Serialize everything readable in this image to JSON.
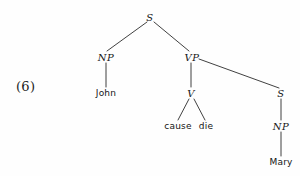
{
  "figure": {
    "example_number": "(6)",
    "caption": ""
  },
  "tree": {
    "nodes": [
      {
        "id": "S-root",
        "label": "S",
        "kind": "category",
        "x": 150,
        "y": 17
      },
      {
        "id": "NP-subj",
        "label": "NP",
        "kind": "category",
        "x": 106,
        "y": 57
      },
      {
        "id": "John",
        "label": "John",
        "kind": "terminal",
        "x": 106,
        "y": 93
      },
      {
        "id": "VP",
        "label": "VP",
        "kind": "category",
        "x": 192,
        "y": 57
      },
      {
        "id": "V",
        "label": "V",
        "kind": "category",
        "x": 191,
        "y": 93
      },
      {
        "id": "cause",
        "label": "cause",
        "kind": "terminal",
        "x": 178,
        "y": 126
      },
      {
        "id": "die",
        "label": "die",
        "kind": "terminal",
        "x": 206,
        "y": 126
      },
      {
        "id": "S-emb",
        "label": "S",
        "kind": "category",
        "x": 281,
        "y": 93
      },
      {
        "id": "NP-obj",
        "label": "NP",
        "kind": "category",
        "x": 281,
        "y": 126
      },
      {
        "id": "Mary",
        "label": "Mary",
        "kind": "terminal",
        "x": 281,
        "y": 162
      }
    ],
    "edges": [
      {
        "from": "S-root",
        "to": "NP-subj",
        "x1": 147,
        "y1": 22,
        "x2": 107,
        "y2": 51
      },
      {
        "from": "S-root",
        "to": "VP",
        "x1": 154,
        "y1": 22,
        "x2": 189,
        "y2": 51
      },
      {
        "from": "NP-subj",
        "to": "John",
        "x1": 106,
        "y1": 63,
        "x2": 106,
        "y2": 87
      },
      {
        "from": "VP",
        "to": "V",
        "x1": 191,
        "y1": 63,
        "x2": 191,
        "y2": 87
      },
      {
        "from": "VP",
        "to": "S-emb",
        "x1": 199,
        "y1": 59,
        "x2": 279,
        "y2": 88
      },
      {
        "from": "V",
        "to": "cause",
        "x1": 189,
        "y1": 99,
        "x2": 178,
        "y2": 120
      },
      {
        "from": "V",
        "to": "die",
        "x1": 194,
        "y1": 99,
        "x2": 205,
        "y2": 120
      },
      {
        "from": "S-emb",
        "to": "NP-obj",
        "x1": 281,
        "y1": 99,
        "x2": 281,
        "y2": 120
      },
      {
        "from": "NP-obj",
        "to": "Mary",
        "x1": 281,
        "y1": 132,
        "x2": 281,
        "y2": 156
      }
    ],
    "stroke_color": "#2b2b2b",
    "stroke_width": 0.9
  },
  "colors": {
    "background": "#fefefe",
    "ink": "#151515"
  }
}
